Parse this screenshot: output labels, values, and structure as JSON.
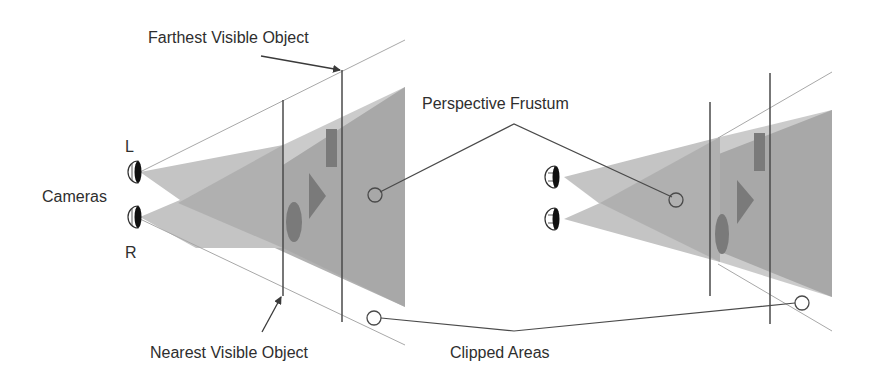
{
  "labels": {
    "farthest": "Farthest Visible Object",
    "nearest": "Nearest Visible Object",
    "cameras": "Cameras",
    "cam_left": "L",
    "cam_right": "R",
    "perspective_frustum": "Perspective Frustum",
    "clipped_areas": "Clipped Areas"
  },
  "colors": {
    "background": "#ffffff",
    "frustum_dark": "#9a9a9a",
    "frustum_mid": "#b4b4b4",
    "frustum_light": "#c8c8c8",
    "object": "#7a7a7a",
    "line": "#4a4a4a",
    "guide": "#a8a8a8",
    "text": "#2e2e2e"
  }
}
